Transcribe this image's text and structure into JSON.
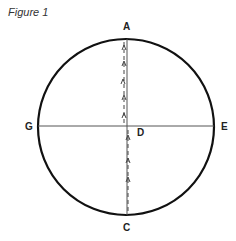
{
  "caption": "Figure 1",
  "labels": {
    "top": "A",
    "bottom": "C",
    "left": "G",
    "right": "E",
    "center": "D"
  },
  "colors": {
    "stroke": "#111111",
    "dashed": "#444444",
    "text": "#222222"
  }
}
